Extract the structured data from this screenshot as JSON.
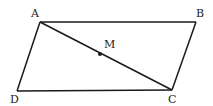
{
  "figure": {
    "type": "parallelogram",
    "points": {
      "A": {
        "label": "A",
        "x": 40,
        "y": 22
      },
      "B": {
        "label": "B",
        "x": 196,
        "y": 22
      },
      "C": {
        "label": "C",
        "x": 172,
        "y": 90
      },
      "D": {
        "label": "D",
        "x": 17,
        "y": 91
      },
      "M": {
        "label": "M",
        "x": 100,
        "y": 54
      }
    },
    "segments": [
      "AB",
      "BC",
      "CD",
      "DA",
      "AC"
    ],
    "colors": {
      "stroke": "#1a1a1a",
      "background": "#ffffff"
    }
  }
}
